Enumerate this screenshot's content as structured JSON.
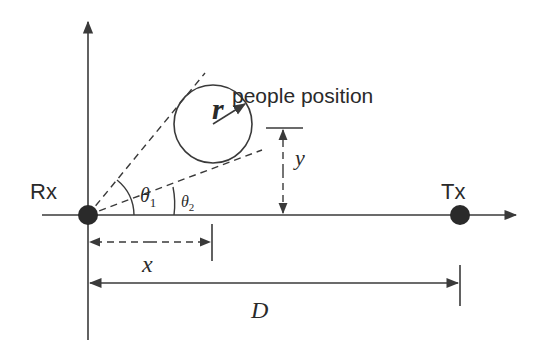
{
  "diagram": {
    "title_label": "people position",
    "receiver_label": "Rx",
    "transmitter_label": "Tx",
    "radius_label": "r",
    "theta1_symbol": "θ",
    "theta1_sub": "1",
    "theta2_symbol": "θ",
    "theta2_sub": "2",
    "x_label": "x",
    "y_label": "y",
    "distance_label": "D",
    "colors": {
      "stroke": "#3a3a3a",
      "text": "#2a2a2a",
      "background": "#ffffff"
    }
  }
}
